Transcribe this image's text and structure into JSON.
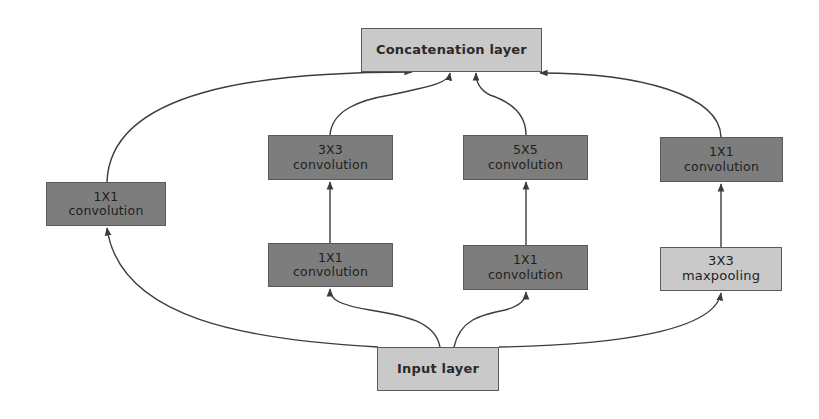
{
  "diagram": {
    "nodes": [
      {
        "id": "concat",
        "label_lines": [
          "Concatenation layer"
        ],
        "style": "light",
        "x": 361,
        "y": 28,
        "w": 181,
        "h": 44
      },
      {
        "id": "conv1x1_direct",
        "label_lines": [
          "1X1",
          "convolution"
        ],
        "style": "dark",
        "x": 46,
        "y": 182,
        "w": 120,
        "h": 44
      },
      {
        "id": "conv3x3",
        "label_lines": [
          "3X3",
          "convolution"
        ],
        "style": "dark",
        "x": 268,
        "y": 135,
        "w": 125,
        "h": 45
      },
      {
        "id": "conv5x5",
        "label_lines": [
          "5X5",
          "convolution"
        ],
        "style": "dark",
        "x": 463,
        "y": 135,
        "w": 125,
        "h": 45
      },
      {
        "id": "conv1x1_pool",
        "label_lines": [
          "1X1",
          "convolution"
        ],
        "style": "dark",
        "x": 660,
        "y": 137,
        "w": 123,
        "h": 45
      },
      {
        "id": "conv1x1_reduce3",
        "label_lines": [
          "1X1",
          "convolution"
        ],
        "style": "dark",
        "x": 268,
        "y": 243,
        "w": 125,
        "h": 44
      },
      {
        "id": "conv1x1_reduce5",
        "label_lines": [
          "1X1",
          "convolution"
        ],
        "style": "dark",
        "x": 463,
        "y": 245,
        "w": 125,
        "h": 45
      },
      {
        "id": "maxpool3x3",
        "label_lines": [
          "3X3",
          "maxpooling"
        ],
        "style": "light",
        "x": 660,
        "y": 247,
        "w": 122,
        "h": 44
      },
      {
        "id": "input",
        "label_lines": [
          "Input layer"
        ],
        "style": "light",
        "x": 377,
        "y": 347,
        "w": 122,
        "h": 44
      }
    ],
    "edges": [
      {
        "from": "input",
        "to": "conv1x1_direct"
      },
      {
        "from": "input",
        "to": "conv1x1_reduce3"
      },
      {
        "from": "input",
        "to": "conv1x1_reduce5"
      },
      {
        "from": "input",
        "to": "maxpool3x3"
      },
      {
        "from": "conv1x1_reduce3",
        "to": "conv3x3"
      },
      {
        "from": "conv1x1_reduce5",
        "to": "conv5x5"
      },
      {
        "from": "maxpool3x3",
        "to": "conv1x1_pool"
      },
      {
        "from": "conv1x1_direct",
        "to": "concat"
      },
      {
        "from": "conv3x3",
        "to": "concat"
      },
      {
        "from": "conv5x5",
        "to": "concat"
      },
      {
        "from": "conv1x1_pool",
        "to": "concat"
      }
    ],
    "colors": {
      "dark_box": "#7d7d7d",
      "light_box": "#c9c9c9",
      "line": "#3c3c3c",
      "border": "#5a5a5a"
    }
  }
}
